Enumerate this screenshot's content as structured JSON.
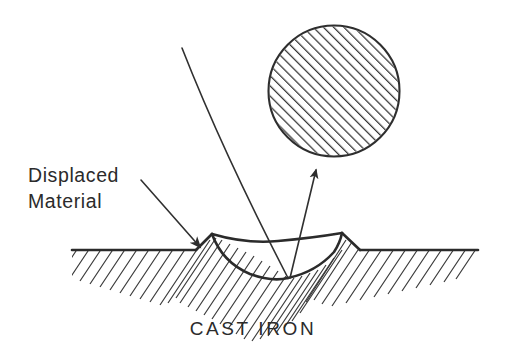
{
  "figure": {
    "background_color": "#ffffff",
    "ink_color": "#2e2e2e",
    "width": 507,
    "height": 353
  },
  "labels": {
    "displaced_material_line1": "Displaced",
    "displaced_material_line2": "Material",
    "substrate": "CAST IRON"
  },
  "elements": {
    "abrasive_particle": {
      "name": "abrasive-particle",
      "shape": "circle",
      "hatched": true,
      "hatch_direction": "lower-left to upper-right",
      "center_x": 334,
      "center_y": 91,
      "radius": 66
    },
    "substrate_surface": {
      "name": "cast-iron-surface",
      "hatched": true,
      "hatch_direction": "upper-right to lower-left",
      "surface_left_x": 72,
      "surface_right_x": 478,
      "surface_y": 250
    },
    "groove": {
      "name": "wear-groove",
      "left_ridge_x": 212,
      "left_ridge_y": 234,
      "right_ridge_x": 342,
      "right_ridge_y": 233,
      "bottom_x": 288,
      "bottom_y": 278
    },
    "trajectory_line": {
      "name": "particle-path-line",
      "from_x": 182,
      "from_y": 48,
      "to_x": 288,
      "to_y": 278
    },
    "exit_arrow": {
      "name": "particle-exit-arrow",
      "from_x": 290,
      "from_y": 278,
      "to_x": 316,
      "to_y": 166
    },
    "callout_arrow": {
      "name": "displaced-material-arrow",
      "from_x": 141,
      "from_y": 180,
      "to_x": 203,
      "to_y": 250
    }
  }
}
